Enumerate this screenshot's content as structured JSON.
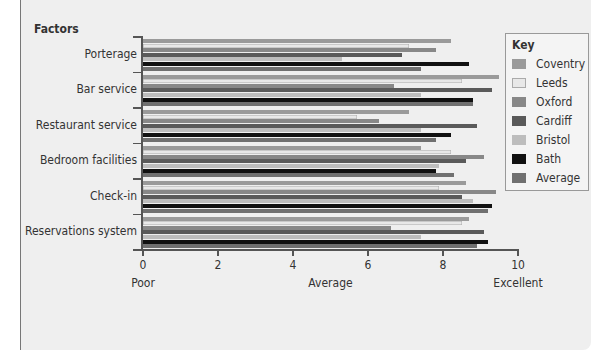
{
  "chart_data": {
    "type": "bar",
    "orientation": "horizontal",
    "title": "Factors",
    "xlabel": "",
    "ylabel": "Factors",
    "xlim": [
      0,
      10
    ],
    "xticks": [
      0,
      2,
      4,
      6,
      8,
      10
    ],
    "xtick_labels": [
      "0",
      "2",
      "4",
      "6",
      "8",
      "10"
    ],
    "x_category_labels": [
      {
        "x": 0,
        "label": "Poor"
      },
      {
        "x": 5,
        "label": "Average"
      },
      {
        "x": 10,
        "label": "Excellent"
      }
    ],
    "grid": false,
    "legend_title": "Key",
    "legend_position": "right",
    "categories": [
      "Porterage",
      "Bar service",
      "Restaurant service",
      "Bedroom facilities",
      "Check-in",
      "Reservations system"
    ],
    "series": [
      {
        "name": "Coventry",
        "color": "#9a9a9a",
        "values": [
          8.2,
          9.5,
          7.1,
          7.4,
          8.6,
          8.7
        ]
      },
      {
        "name": "Leeds",
        "color": "#e8e8e8",
        "values": [
          7.1,
          8.5,
          5.7,
          8.2,
          7.9,
          8.5
        ]
      },
      {
        "name": "Oxford",
        "color": "#888888",
        "values": [
          7.8,
          6.7,
          6.3,
          9.1,
          9.4,
          6.6
        ]
      },
      {
        "name": "Cardiff",
        "color": "#5a5a5a",
        "values": [
          6.9,
          9.3,
          8.9,
          8.6,
          8.5,
          9.1
        ]
      },
      {
        "name": "Bristol",
        "color": "#bdbdbd",
        "values": [
          5.3,
          7.4,
          7.4,
          7.9,
          8.8,
          7.4
        ]
      },
      {
        "name": "Bath",
        "color": "#111111",
        "values": [
          8.7,
          8.8,
          8.2,
          7.8,
          9.3,
          9.2
        ]
      },
      {
        "name": "Average",
        "color": "#707070",
        "values": [
          7.4,
          8.8,
          7.8,
          8.3,
          9.2,
          8.9
        ]
      }
    ]
  },
  "labels": {
    "title": "Factors",
    "key_title": "Key",
    "poor": "Poor",
    "average": "Average",
    "excellent": "Excellent"
  }
}
